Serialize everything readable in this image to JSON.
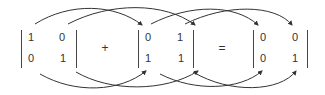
{
  "diagram": {
    "type": "matrix-equation",
    "stroke_color": "#333333",
    "matrices": [
      {
        "name": "A",
        "cells": [
          [
            "1",
            "0"
          ],
          [
            "0",
            "1"
          ]
        ]
      },
      {
        "name": "B",
        "cells": [
          [
            "0",
            "1"
          ],
          [
            "1",
            "1"
          ]
        ]
      },
      {
        "name": "C",
        "cells": [
          [
            "0",
            "0"
          ],
          [
            "0",
            "1"
          ]
        ]
      }
    ],
    "operators": {
      "plus": "+",
      "equals": "="
    },
    "arrows": [
      {
        "from": "A.col1",
        "to": "B.col1",
        "side": "top"
      },
      {
        "from": "A.col2",
        "to": "B.col2",
        "side": "top"
      },
      {
        "from": "B.col1",
        "to": "C.col1",
        "side": "top"
      },
      {
        "from": "B.col2",
        "to": "C.col2",
        "side": "top"
      },
      {
        "from": "A.col1",
        "to": "B.col1",
        "side": "bottom"
      },
      {
        "from": "A.col2",
        "to": "B.col2",
        "side": "bottom"
      },
      {
        "from": "B.col1",
        "to": "C.col1",
        "side": "bottom"
      },
      {
        "from": "B.col2",
        "to": "C.col2",
        "side": "bottom"
      }
    ]
  }
}
